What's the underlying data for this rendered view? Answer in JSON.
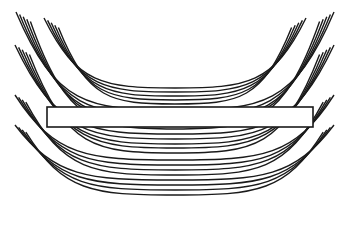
{
  "figure": {
    "colors": {
      "stroke": "#1a1a1a",
      "background": "#ffffff",
      "bar_fill": "#ffffff"
    },
    "bar": {
      "x": 47,
      "y": 107,
      "width": 266,
      "height": 20
    },
    "arc_center_x": 175,
    "arc_groups": [
      {
        "name": "upper-inner",
        "left_x": 44,
        "right_x": 306,
        "top_y": 18,
        "bottoms": [
          88,
          92,
          96,
          100,
          104
        ]
      },
      {
        "name": "upper-outer",
        "left_x": 16,
        "right_x": 334,
        "top_y": 12,
        "bottoms": [
          110,
          115,
          120,
          124,
          129
        ]
      },
      {
        "name": "middle",
        "left_x": 15,
        "right_x": 334,
        "top_y": 45,
        "bottoms": [
          134,
          139,
          144,
          148,
          153
        ]
      },
      {
        "name": "lower",
        "left_x": 15,
        "right_x": 334,
        "top_y": 95,
        "bottoms": [
          160,
          165,
          170,
          175
        ]
      },
      {
        "name": "bottom",
        "left_x": 15,
        "right_x": 334,
        "top_y": 125,
        "bottoms": [
          180,
          185,
          190,
          195
        ]
      }
    ]
  }
}
